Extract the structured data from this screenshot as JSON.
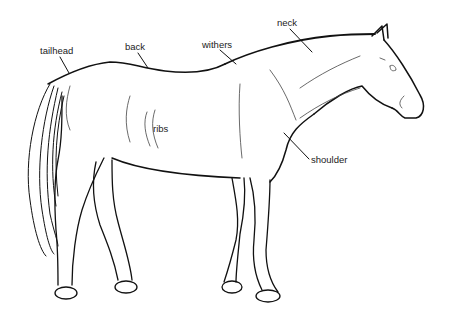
{
  "diagram": {
    "style": "black line drawing on white",
    "colors": {
      "background": "#ffffff",
      "line": "#111111",
      "label_text": "#222222"
    },
    "labels": [
      {
        "id": "tailhead",
        "text": "tailhead",
        "x": 40,
        "y": 46
      },
      {
        "id": "back",
        "text": "back",
        "x": 125,
        "y": 42
      },
      {
        "id": "withers",
        "text": "withers",
        "x": 202,
        "y": 40
      },
      {
        "id": "neck",
        "text": "neck",
        "x": 277,
        "y": 18
      },
      {
        "id": "ribs",
        "text": "ribs",
        "x": 153,
        "y": 124
      },
      {
        "id": "shoulder",
        "text": "shoulder",
        "x": 311,
        "y": 155
      }
    ]
  }
}
